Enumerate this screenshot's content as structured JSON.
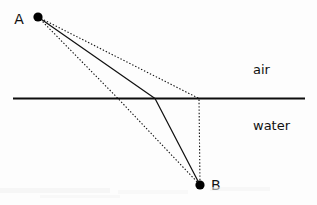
{
  "figure": {
    "background_color": "#fdfdfd",
    "ink_color": "#111111",
    "width": 317,
    "height": 205
  },
  "interface": {
    "label": "interface-line",
    "x1": 13,
    "y1": 98.5,
    "x2": 305,
    "y2": 98.5,
    "stroke": "#0d0d0d"
  },
  "media": {
    "upper": {
      "name": "air",
      "label_x": 253,
      "label_y": 74
    },
    "lower": {
      "name": "water",
      "label_x": 253,
      "label_y": 130
    }
  },
  "points": {
    "a": {
      "name": "A",
      "x": 38,
      "y": 17,
      "radius": 4.6,
      "label_x": 19,
      "label_y": 24
    },
    "b": {
      "name": "B",
      "x": 200,
      "y": 185,
      "radius": 4.6,
      "label_x": 211,
      "label_y": 190
    }
  },
  "paths": {
    "actual": {
      "name": "actual-refracted-ray",
      "style": "solid",
      "crossing_x": 155,
      "d": "M 38 17 L 155 98.5 L 200 185"
    },
    "alt_shallow": {
      "name": "alternate-path-shallow",
      "style": "dotted",
      "crossing_x": 199,
      "d": "M 38 17 L 199 98.5 L 200 185"
    },
    "alt_steep": {
      "name": "alternate-path-steep",
      "style": "dotted",
      "crossing_x": 118,
      "d": "M 38 17 L 118 98.5 L 200 185"
    }
  }
}
